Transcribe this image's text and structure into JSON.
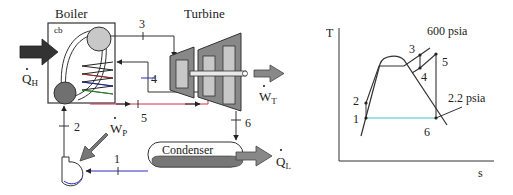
{
  "schematic": {
    "boiler_label": "Boiler",
    "boiler_sub_label": "cb",
    "turbine_label": "Turbine",
    "condenser_label": "Condenser",
    "heat_in_label": "Q",
    "heat_in_sub": "H",
    "heat_out_label": "Q",
    "heat_out_sub": "L",
    "pump_work_label": "W",
    "pump_work_sub": "P",
    "turbine_work_label": "W",
    "turbine_work_sub": "T",
    "states": {
      "s1": "1",
      "s2": "2",
      "s3": "3",
      "s4": "4",
      "s5": "5",
      "s6": "6"
    }
  },
  "ts_diagram": {
    "y_axis_label": "T",
    "x_axis_label": "s",
    "high_pressure_label": "600 psia",
    "low_pressure_label": "2.2 psia",
    "states": {
      "s1": "1",
      "s2": "2",
      "s3": "3",
      "s4": "4",
      "s5": "5",
      "s6": "6"
    }
  },
  "colors": {
    "line": "#333333",
    "grey_dark": "#666666",
    "grey_mid": "#8c8c8c",
    "grey_light": "#c8c8c8",
    "red_line": "#d0304a",
    "blue_line": "#2a2ac0",
    "cyan_line": "#40c8c8"
  }
}
